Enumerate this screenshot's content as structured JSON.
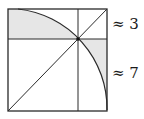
{
  "diagram": {
    "labels": [
      {
        "text": "≈ 3",
        "x": 111,
        "y": 18
      },
      {
        "text": "≈ 7",
        "x": 111,
        "y": 66
      }
    ],
    "colors": {
      "stroke": "#2a2a2a",
      "shade": "#e6e6e6",
      "background": "#ffffff"
    }
  }
}
